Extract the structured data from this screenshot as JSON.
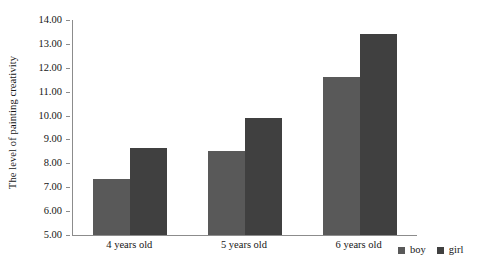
{
  "chart_data": {
    "type": "bar",
    "title": "",
    "subtitle": "",
    "xlabel": "",
    "ylabel": "The level of painting creativity",
    "categories": [
      "4 years old",
      "5 years old",
      "6 years old"
    ],
    "series": [
      {
        "name": "boy",
        "values": [
          7.35,
          8.5,
          11.6
        ],
        "color": "#595959"
      },
      {
        "name": "girl",
        "values": [
          8.65,
          9.9,
          13.4
        ],
        "color": "#404040"
      }
    ],
    "ylim": [
      5.0,
      14.0
    ],
    "ytick_step": 1.0,
    "ytick_labels": [
      "14.00",
      "13.00",
      "12.00",
      "11.00",
      "10.00",
      "9.00",
      "8.00",
      "7.00",
      "6.00",
      "5.00"
    ],
    "ytick_values": [
      14,
      13,
      12,
      11,
      10,
      9,
      8,
      7,
      6,
      5
    ],
    "grid": false,
    "legend_position": "bottom-right",
    "legend_entries": [
      "boy",
      "girl"
    ]
  },
  "axes": {
    "y_title": "The level of painting creativity",
    "axis_color": "#8c8c8c"
  }
}
